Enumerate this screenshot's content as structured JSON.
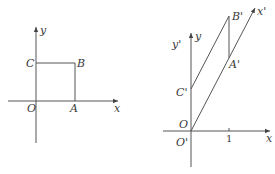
{
  "figures": [
    {
      "id": "original",
      "description": "Square OABC in Cartesian coordinates",
      "axes": {
        "x_label": "x",
        "y_label": "y"
      },
      "points": [
        {
          "name": "O",
          "label": "O"
        },
        {
          "name": "A",
          "label": "A"
        },
        {
          "name": "B",
          "label": "B"
        },
        {
          "name": "C",
          "label": "C"
        }
      ]
    },
    {
      "id": "oblique",
      "description": "Parallelogram O'A'B'C' with oblique x' axis",
      "axes": {
        "x_label": "x",
        "y_label": "y",
        "x_prime_label": "x'",
        "y_prime_label": "y'"
      },
      "points": [
        {
          "name": "O",
          "label": "O"
        },
        {
          "name": "O'",
          "label": "O'"
        },
        {
          "name": "A'",
          "label": "A'"
        },
        {
          "name": "B'",
          "label": "B'"
        },
        {
          "name": "C'",
          "label": "C'"
        }
      ],
      "tick_label": "1"
    }
  ]
}
